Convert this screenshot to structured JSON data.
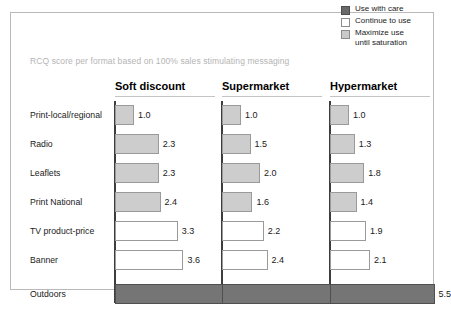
{
  "subtitle": "RCQ score per format based on 100% sales stimulating messaging",
  "legend": {
    "items": [
      {
        "label": "Use with care",
        "swatch": "dark-gray-swatch-icon",
        "color": "#696969",
        "category": "care"
      },
      {
        "label": "Continue to use",
        "swatch": "white-swatch-icon",
        "color": "#ffffff",
        "category": "continue"
      },
      {
        "label": "Maximize use\nuntil saturation",
        "swatch": "light-gray-swatch-icon",
        "color": "#c9c9c9",
        "category": "maximize"
      }
    ]
  },
  "chart_data": {
    "type": "bar",
    "title": "",
    "subtitle": "RCQ score per format based on 100% sales stimulating messaging",
    "orientation": "horizontal",
    "xlabel": "",
    "ylabel": "",
    "xlim": [
      0,
      7
    ],
    "grid": false,
    "legend_position": "top-right",
    "categories": [
      "Print-local/regional",
      "Radio",
      "Leaflets",
      "Print National",
      "TV product-price",
      "Banner",
      "Outdoors"
    ],
    "category_styles": [
      "maximize",
      "maximize",
      "maximize",
      "maximize",
      "continue",
      "continue",
      "care"
    ],
    "panels": [
      {
        "name": "Soft discount",
        "values": [
          1.0,
          2.3,
          2.3,
          2.4,
          3.3,
          3.6,
          6.5
        ]
      },
      {
        "name": "Supermarket",
        "values": [
          1.0,
          1.5,
          2.0,
          1.6,
          2.2,
          2.4,
          6.3
        ]
      },
      {
        "name": "Hypermarket",
        "values": [
          1.0,
          1.3,
          1.8,
          1.4,
          1.9,
          2.1,
          5.5
        ]
      }
    ],
    "value_labels": [
      [
        "1.0",
        "2.3",
        "2.3",
        "2.4",
        "3.3",
        "3.6",
        "6.5"
      ],
      [
        "1.0",
        "1.5",
        "2.0",
        "1.6",
        "2.2",
        "2.4",
        "6.3"
      ],
      [
        "1.0",
        "1.3",
        "1.8",
        "1.4",
        "1.9",
        "2.1",
        "5.5"
      ]
    ],
    "series_colors": {
      "care": "#757575",
      "continue": "#ffffff",
      "maximize": "#cdcdcd"
    }
  }
}
